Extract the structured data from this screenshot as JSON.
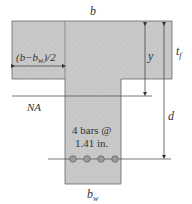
{
  "labels": {
    "b": "b",
    "flange_overhang": "(b−b",
    "flange_overhang_sub": "w",
    "flange_overhang_tail": ")/2",
    "y": "y",
    "tf": "t",
    "tf_sub": "f",
    "na": "NA",
    "d": "d",
    "bars_line1": "4 bars @",
    "bars_line2": "1.41 in.",
    "bw": "b",
    "bw_sub": "w"
  },
  "colors": {
    "concrete": "#c9c9c9",
    "outline": "#555555",
    "rebar": "#9a9a9a"
  }
}
